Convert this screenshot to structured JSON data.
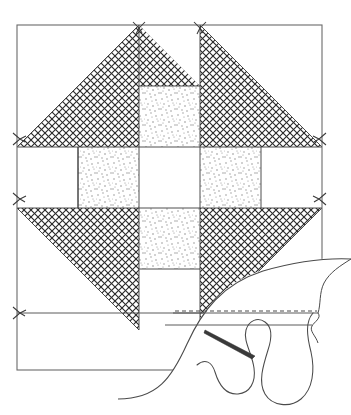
{
  "illustration": {
    "title": "Quilt block with folded fabric, needle and thread",
    "type": "line-drawing",
    "background_color": "#ffffff",
    "ink_color": "#3a3a3a",
    "line_color_light": "#8a8a8a",
    "crosshatch_color": "#2b2b2b",
    "stipple_color": "#9a9a9a"
  },
  "frame": {
    "name": "outer-fabric-panel",
    "x": 17,
    "y": 25,
    "width": 305,
    "height": 345,
    "note": "outer fabric panel border"
  },
  "block": {
    "name": "quilt-block",
    "x": 17,
    "y": 25,
    "size": 305,
    "grid": 5,
    "cell_size": 61,
    "column_edges": [
      17,
      78,
      139,
      200,
      261,
      322
    ],
    "row_edges": [
      25,
      86,
      147,
      208,
      269,
      330
    ],
    "patches": [
      {
        "row": 0,
        "col": 0,
        "fill": "plain"
      },
      {
        "row": 0,
        "col": 1,
        "fill": "crosshatch-triangle",
        "corner": "br"
      },
      {
        "row": 0,
        "col": 2,
        "fill": "plain"
      },
      {
        "row": 0,
        "col": 3,
        "fill": "crosshatch-triangle",
        "corner": "bl"
      },
      {
        "row": 0,
        "col": 4,
        "fill": "plain"
      },
      {
        "row": 1,
        "col": 0,
        "fill": "crosshatch-triangle",
        "corner": "br"
      },
      {
        "row": 1,
        "col": 1,
        "fill": "crosshatch"
      },
      {
        "row": 1,
        "col": 2,
        "fill": "stipple"
      },
      {
        "row": 1,
        "col": 3,
        "fill": "crosshatch"
      },
      {
        "row": 1,
        "col": 4,
        "fill": "crosshatch-triangle",
        "corner": "bl"
      },
      {
        "row": 2,
        "col": 0,
        "fill": "plain"
      },
      {
        "row": 2,
        "col": 1,
        "fill": "stipple"
      },
      {
        "row": 2,
        "col": 2,
        "fill": "plain"
      },
      {
        "row": 2,
        "col": 3,
        "fill": "stipple"
      },
      {
        "row": 2,
        "col": 4,
        "fill": "plain"
      },
      {
        "row": 3,
        "col": 0,
        "fill": "crosshatch-triangle",
        "corner": "tr"
      },
      {
        "row": 3,
        "col": 1,
        "fill": "crosshatch"
      },
      {
        "row": 3,
        "col": 2,
        "fill": "stipple"
      },
      {
        "row": 3,
        "col": 3,
        "fill": "crosshatch"
      },
      {
        "row": 3,
        "col": 4,
        "fill": "crosshatch-triangle",
        "corner": "tl"
      },
      {
        "row": 4,
        "col": 0,
        "fill": "plain"
      },
      {
        "row": 4,
        "col": 1,
        "fill": "crosshatch-triangle",
        "corner": "tr"
      },
      {
        "row": 4,
        "col": 2,
        "fill": "plain"
      },
      {
        "row": 4,
        "col": 3,
        "fill": "crosshatch-triangle",
        "corner": "tl"
      },
      {
        "row": 4,
        "col": 4,
        "fill": "plain"
      }
    ]
  },
  "pins": [
    {
      "name": "pin-top-left",
      "x": 139,
      "y": 25,
      "orientation": "horizontal"
    },
    {
      "name": "pin-top-right",
      "x": 200,
      "y": 25,
      "orientation": "horizontal"
    },
    {
      "name": "pin-left-upper",
      "x": 17,
      "y": 139,
      "orientation": "vertical"
    },
    {
      "name": "pin-left-lower",
      "x": 17,
      "y": 199,
      "orientation": "vertical"
    },
    {
      "name": "pin-right-upper",
      "x": 322,
      "y": 139,
      "orientation": "vertical"
    },
    {
      "name": "pin-right-lower",
      "x": 322,
      "y": 199,
      "orientation": "vertical"
    },
    {
      "name": "pin-left-bottom",
      "x": 17,
      "y": 313,
      "orientation": "vertical"
    }
  ],
  "seam_line": {
    "name": "bottom-seam-line",
    "y": 313,
    "x1": 17,
    "x2": 322
  },
  "folded_corner": {
    "name": "folded-fabric-flap",
    "fold_curve": "sweeping S-curve from upper right edge down to lower left",
    "stitch_line": {
      "name": "dashed-stitching-line",
      "style": "dashed",
      "y": 313,
      "x1": 172,
      "x2": 318
    }
  },
  "needle": {
    "name": "sewing-needle",
    "tip": {
      "x": 254,
      "y": 355
    },
    "tail": {
      "x": 205,
      "y": 331
    },
    "angle_deg": 26
  },
  "thread": {
    "name": "thread-curve",
    "description": "wavy thread with two large loops trailing from the needle eye",
    "loops": 2
  }
}
